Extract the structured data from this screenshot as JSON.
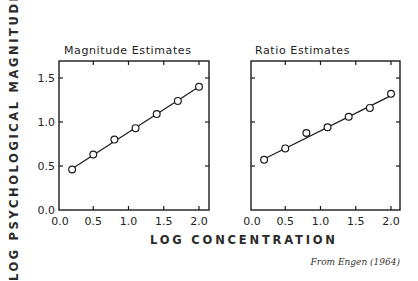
{
  "ylabel": "LOG PSYCHOLOGICAL MAGNITUDE",
  "xlabel": "LOG CONCENTRATION",
  "source": "From Engen (1964)",
  "panels": [
    {
      "title": "Magnitude Estimates"
    },
    {
      "title": "Ratio Estimates"
    }
  ],
  "chart_data": [
    {
      "type": "scatter",
      "title": "Magnitude Estimates",
      "xlabel": "LOG CONCENTRATION",
      "ylabel": "LOG PSYCHOLOGICAL MAGNITUDE",
      "x": [
        0.2,
        0.5,
        0.8,
        1.1,
        1.4,
        1.7,
        2.0
      ],
      "y": [
        0.46,
        0.63,
        0.8,
        0.93,
        1.09,
        1.24,
        1.4
      ],
      "fit_line": {
        "x": [
          0.2,
          2.0
        ],
        "y": [
          0.47,
          1.4
        ]
      },
      "xlim": [
        0.0,
        2.1
      ],
      "ylim": [
        0.0,
        1.7
      ],
      "xticks": [
        "0.0",
        "0.5",
        "1.0",
        "1.5",
        "2.0"
      ],
      "yticks": [
        "0.0",
        "0.5",
        "1.0",
        "1.5"
      ],
      "marker": "open circle",
      "grid": false
    },
    {
      "type": "scatter",
      "title": "Ratio Estimates",
      "xlabel": "LOG CONCENTRATION",
      "ylabel": "LOG PSYCHOLOGICAL MAGNITUDE",
      "x": [
        0.2,
        0.5,
        0.8,
        1.1,
        1.4,
        1.7,
        2.0
      ],
      "y": [
        0.57,
        0.7,
        0.875,
        0.94,
        1.06,
        1.16,
        1.32
      ],
      "fit_line": {
        "x": [
          0.2,
          2.0
        ],
        "y": [
          0.58,
          1.3
        ]
      },
      "xlim": [
        0.0,
        2.1
      ],
      "ylim": [
        0.0,
        1.7
      ],
      "xticks": [
        "0.0",
        "0.5",
        "1.0",
        "1.5",
        "2.0"
      ],
      "yticks": [],
      "marker": "open circle",
      "grid": false
    }
  ]
}
